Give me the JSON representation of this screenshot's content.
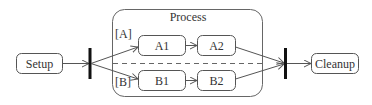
{
  "diagram": {
    "type": "UML activity diagram",
    "frame": {
      "title": "Process"
    },
    "nodes": [
      {
        "id": "setup",
        "label": "Setup"
      },
      {
        "id": "a1",
        "label": "A1"
      },
      {
        "id": "a2",
        "label": "A2"
      },
      {
        "id": "b1",
        "label": "B1"
      },
      {
        "id": "b2",
        "label": "B2"
      },
      {
        "id": "cleanup",
        "label": "Cleanup"
      }
    ],
    "guards": {
      "a": "[A]",
      "b": "[B]"
    },
    "bars": [
      "fork",
      "join"
    ],
    "edges": [
      [
        "setup",
        "fork"
      ],
      [
        "fork",
        "a1"
      ],
      [
        "fork",
        "b1"
      ],
      [
        "a1",
        "a2"
      ],
      [
        "b1",
        "b2"
      ],
      [
        "a2",
        "join"
      ],
      [
        "b2",
        "join"
      ],
      [
        "join",
        "cleanup"
      ]
    ],
    "colors": {
      "stroke": "#555555",
      "bar": "#111111",
      "text": "#333333"
    }
  }
}
